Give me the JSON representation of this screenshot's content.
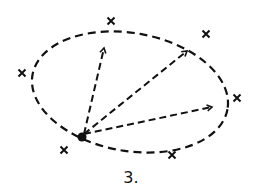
{
  "figure": {
    "label": "3.",
    "ellipse": {
      "cx": 130,
      "cy": 92,
      "rx": 99,
      "ry": 59,
      "rotate": 10,
      "style": "dashed"
    },
    "origin_point": {
      "x": 82,
      "y": 137
    },
    "arrows": [
      {
        "to_x": 104,
        "to_y": 48
      },
      {
        "to_x": 187,
        "to_y": 51
      },
      {
        "to_x": 212,
        "to_y": 107
      }
    ],
    "x_marks": [
      {
        "x": 111,
        "y": 21
      },
      {
        "x": 206,
        "y": 34
      },
      {
        "x": 22,
        "y": 73
      },
      {
        "x": 237,
        "y": 98
      },
      {
        "x": 64,
        "y": 150
      },
      {
        "x": 172,
        "y": 155
      }
    ],
    "color": "#111111"
  }
}
